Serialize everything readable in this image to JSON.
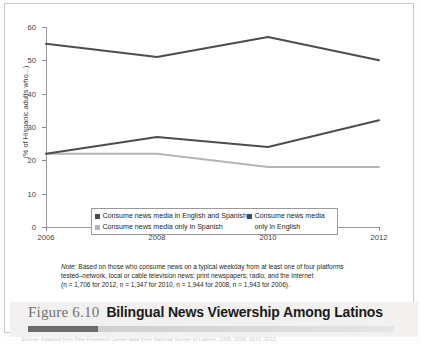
{
  "figure": {
    "number": "Figure 6.10",
    "title": "Bilingual News Viewership Among Latinos"
  },
  "note": {
    "label": "Note:",
    "line1": " Based on those who consume news on a typical weekday from at least one of four platforms",
    "line2": "tested–network, local or cable television news; print newspapers; radio; and the Internet",
    "line3": "(n = 1,706 for 2012, n = 1,347 for 2010, n = 1,944 for 2008, n = 1,943 for 2006)."
  },
  "source": {
    "text": "Source: Adapted from Pew Research Center data from National Survey of Latinos, 2006, 2008, 2010, 2012."
  },
  "colors": {
    "english_and_spanish": "#4d4d4d",
    "only_in_english": "#4d4d4d",
    "only_in_spanish": "#b4b4b4",
    "axis": "#9a9a9a",
    "caption_band": "#f2f1ef"
  },
  "legend": {
    "items": [
      {
        "label": "Consume news media in English and Spanish",
        "marker": "square-marker"
      },
      {
        "label": "Consume news media",
        "label2": "only in English",
        "marker": "square-marker"
      },
      {
        "label": "Consume news media only in Spanish",
        "marker": "square-marker"
      }
    ]
  },
  "chart_data": {
    "type": "line",
    "title": "Bilingual News Viewership Among Latinos",
    "xlabel": "",
    "ylabel": "(% of Hispanic adults who...)",
    "x": [
      2006,
      2008,
      2010,
      2012
    ],
    "xticklabels": [
      "2006",
      "2008",
      "2010",
      "2012"
    ],
    "yticklabels": [
      "0",
      "10",
      "20",
      "30",
      "40",
      "50",
      "60"
    ],
    "yticks": [
      0,
      10,
      20,
      30,
      40,
      50,
      60
    ],
    "ylim": [
      0,
      60
    ],
    "xlim": [
      2006,
      2012
    ],
    "grid": false,
    "legend_position": "inside-bottom-center",
    "series": [
      {
        "name": "Consume news media in English and Spanish",
        "color": "#4d4d4d",
        "values": [
          55,
          51,
          57,
          50
        ]
      },
      {
        "name": "Consume news media only in English",
        "color": "#4d4d4d",
        "values": [
          22,
          27,
          24,
          32
        ]
      },
      {
        "name": "Consume news media only in Spanish",
        "color": "#b4b4b4",
        "values": [
          22,
          22,
          18,
          18
        ]
      }
    ]
  }
}
